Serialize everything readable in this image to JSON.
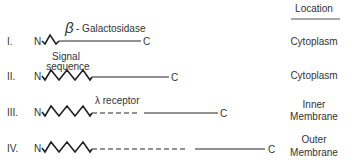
{
  "header": {
    "location_label": "Location"
  },
  "rows": [
    {
      "numeral": "I.",
      "n": "N",
      "c": "C",
      "label": "β- Galactosidase",
      "location": [
        "Cytoplasm"
      ]
    },
    {
      "numeral": "II.",
      "n": "N",
      "c": "C",
      "label": "Signal sequence",
      "label_lines": [
        "Signal",
        "sequence"
      ],
      "location": [
        "Cytoplasm"
      ]
    },
    {
      "numeral": "III.",
      "n": "N",
      "c": "C",
      "label": "λ receptor",
      "location": [
        "Inner",
        "Membrane"
      ]
    },
    {
      "numeral": "IV.",
      "n": "N",
      "c": "C",
      "label": "",
      "location": [
        "Outer",
        "Membrane"
      ]
    }
  ],
  "labels": {
    "beta": "β",
    "galactosidase": "- Galactosidase",
    "signal_1": "Signal",
    "signal_2": "sequence",
    "lambda_receptor": "λ receptor"
  },
  "colors": {
    "line": "#222222",
    "text": "#333333"
  }
}
